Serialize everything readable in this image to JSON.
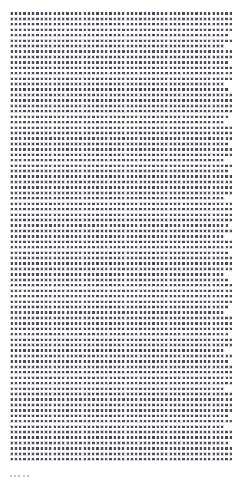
{
  "page": {
    "kind": "document-page-thumbnail",
    "width_px": 243,
    "height_px": 484,
    "background_color": "#ffffff",
    "margin_left_px": 10,
    "margin_top_px": 11,
    "margin_right_px": 10,
    "margin_bottom_px": 21
  },
  "text_block": {
    "description": "Dense body text rendered far below legibility; resolves as a uniform grid of dark marks.",
    "left_px": 10,
    "top_px": 11,
    "width_px": 223,
    "height_px": 453,
    "columns": 52,
    "rows": 83,
    "column_pitch_px": 4.3,
    "row_pitch_px": 5.45,
    "glyph_color": "#3a3a42",
    "halo_color": "rgba(120,120,132,0.30)",
    "legible_text": ""
  },
  "footer_fragment": {
    "description": "Faint illegible mark below the main text block, near the left margin.",
    "left_px": 9,
    "top_px": 472,
    "glyph_count": 5,
    "color": "rgba(140,140,150,0.55)",
    "legible_text": ""
  }
}
